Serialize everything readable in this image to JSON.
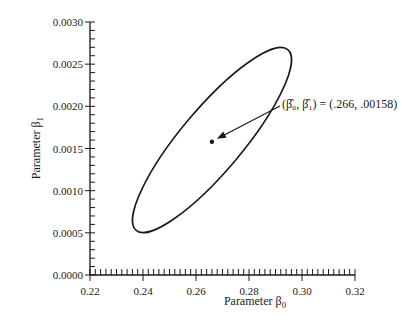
{
  "chart_data": {
    "type": "scatter",
    "title": "",
    "xlabel": "Parameter β0",
    "ylabel": "Parameter β1",
    "xlim": [
      0.22,
      0.32
    ],
    "ylim": [
      0.0,
      0.003
    ],
    "x_ticks": [
      "0.22",
      "0.24",
      "0.26",
      "0.28",
      "0.30",
      "0.32"
    ],
    "y_ticks": [
      "0.0000",
      "0.0005",
      "0.0010",
      "0.0015",
      "0.0020",
      "0.0025",
      "0.0030"
    ],
    "grid": false,
    "legend": null,
    "series": [
      {
        "name": "confidence-ellipse",
        "kind": "ellipse-outline",
        "approx_points": [
          {
            "x": 0.236,
            "y": 0.0027
          },
          {
            "x": 0.229,
            "y": 0.0025
          },
          {
            "x": 0.25,
            "y": 0.0018
          },
          {
            "x": 0.28,
            "y": 0.0008
          },
          {
            "x": 0.296,
            "y": 0.00045
          },
          {
            "x": 0.303,
            "y": 0.0007
          },
          {
            "x": 0.29,
            "y": 0.0013
          },
          {
            "x": 0.26,
            "y": 0.0023
          }
        ]
      },
      {
        "name": "point-estimate",
        "kind": "point",
        "x": 0.266,
        "y": 0.00158
      }
    ],
    "annotations": [
      {
        "text": "(β̂0, β̂1) = (.266, .00158)",
        "points_to": {
          "x": 0.266,
          "y": 0.00158
        }
      }
    ]
  },
  "labels": {
    "xlabel_text": "Parameter β",
    "xlabel_sub": "0",
    "ylabel_text": "Parameter β",
    "ylabel_sub": "1",
    "annotation_text": "(β̂₀, β̂₁) = (.266, .00158)"
  }
}
